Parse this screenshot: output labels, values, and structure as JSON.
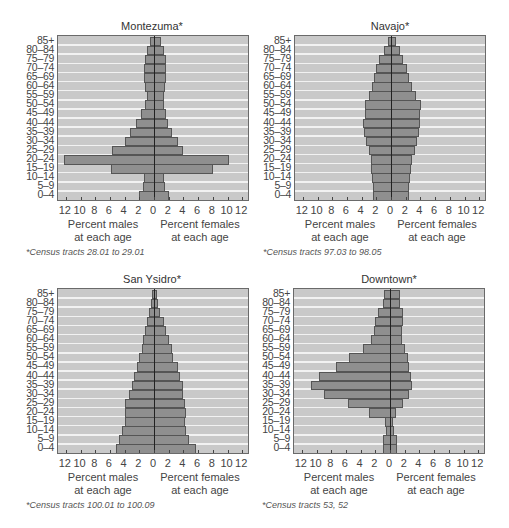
{
  "chart_data": [
    {
      "type": "bar",
      "subtype": "population-pyramid",
      "title": "Montezuma*",
      "footnote": "*Census tracts 28.01 to 29.01",
      "categories": [
        "85+",
        "80–84",
        "75–79",
        "70–74",
        "65–69",
        "60–64",
        "55–59",
        "50–54",
        "45–49",
        "40–44",
        "35–39",
        "30–34",
        "25–29",
        "20–24",
        "15–19",
        "10–14",
        "5–9",
        "0–4"
      ],
      "series": [
        {
          "name": "Percent males at each age",
          "values": [
            0.5,
            1.0,
            1.2,
            1.3,
            1.4,
            1.2,
            1.0,
            1.2,
            1.8,
            2.5,
            3.2,
            4.0,
            5.7,
            12.2,
            5.8,
            1.3,
            1.5,
            2.0
          ]
        },
        {
          "name": "Percent females at each age",
          "values": [
            1.0,
            1.4,
            1.6,
            1.6,
            1.7,
            1.5,
            1.3,
            1.4,
            1.6,
            1.9,
            2.4,
            3.2,
            3.9,
            10.2,
            8.0,
            1.4,
            1.5,
            2.0
          ]
        }
      ],
      "xlabel_left": [
        "Percent males",
        "at each age"
      ],
      "xlabel_right": [
        "Percent females",
        "at each age"
      ],
      "xticks": [
        "12",
        "10",
        "8",
        "6",
        "4",
        "2",
        "0",
        "2",
        "4",
        "6",
        "8",
        "10",
        "12"
      ],
      "xlim": [
        -12,
        12
      ],
      "grid": true
    },
    {
      "type": "bar",
      "subtype": "population-pyramid",
      "title": "Navajo*",
      "footnote": "*Census tracts 97.03 to 98.05",
      "categories": [
        "85+",
        "80–84",
        "75–79",
        "70–74",
        "65–69",
        "60–64",
        "55–59",
        "50–54",
        "45–49",
        "40–44",
        "35–39",
        "30–34",
        "25–29",
        "20–24",
        "15–19",
        "10–14",
        "5–9",
        "0–4"
      ],
      "series": [
        {
          "name": "Percent males at each age",
          "values": [
            0.4,
            0.9,
            1.6,
            2.0,
            2.3,
            2.6,
            3.0,
            3.5,
            3.5,
            3.8,
            3.7,
            3.4,
            3.0,
            2.7,
            2.7,
            2.6,
            2.5,
            2.5
          ]
        },
        {
          "name": "Percent females at each age",
          "values": [
            0.7,
            1.2,
            1.6,
            2.2,
            2.4,
            2.8,
            3.4,
            4.1,
            4.0,
            3.9,
            3.8,
            3.6,
            3.2,
            2.8,
            2.7,
            2.6,
            2.5,
            2.5
          ]
        }
      ],
      "xlabel_left": [
        "Percent males",
        "at each age"
      ],
      "xlabel_right": [
        "Percent females",
        "at each age"
      ],
      "xticks": [
        "12",
        "10",
        "8",
        "6",
        "4",
        "2",
        "0",
        "2",
        "4",
        "6",
        "8",
        "10",
        "12"
      ],
      "xlim": [
        -12,
        12
      ],
      "grid": true
    },
    {
      "type": "bar",
      "subtype": "population-pyramid",
      "title": "San Ysidro*",
      "footnote": "*Census tracts 100.01 to 100.09",
      "categories": [
        "85+",
        "80–84",
        "75–79",
        "70–74",
        "65–69",
        "60–64",
        "55–59",
        "50–54",
        "45–49",
        "40–44",
        "35–39",
        "30–34",
        "25–29",
        "20–24",
        "15–19",
        "10–14",
        "5–9",
        "0–4"
      ],
      "series": [
        {
          "name": "Percent males at each age",
          "values": [
            0.3,
            0.4,
            0.7,
            1.0,
            1.2,
            1.5,
            1.7,
            2.0,
            2.3,
            2.7,
            3.0,
            3.4,
            3.9,
            4.0,
            3.9,
            4.3,
            4.7,
            5.2
          ]
        },
        {
          "name": "Percent females at each age",
          "values": [
            0.4,
            0.6,
            0.8,
            1.3,
            1.7,
            2.0,
            2.4,
            2.6,
            3.2,
            3.6,
            3.9,
            4.0,
            4.2,
            4.4,
            4.2,
            4.3,
            4.7,
            5.7
          ]
        }
      ],
      "xlabel_left": [
        "Percent males",
        "at each age"
      ],
      "xlabel_right": [
        "Percent females",
        "at each age"
      ],
      "xticks": [
        "12",
        "10",
        "8",
        "6",
        "4",
        "2",
        "0",
        "2",
        "4",
        "6",
        "8",
        "10",
        "12"
      ],
      "xlim": [
        -12,
        12
      ],
      "grid": true
    },
    {
      "type": "bar",
      "subtype": "population-pyramid",
      "title": "Downtown*",
      "footnote": "*Census tracts 53, 52",
      "categories": [
        "85+",
        "80–84",
        "75–79",
        "70–74",
        "65–69",
        "60–64",
        "55–59",
        "50–54",
        "45–49",
        "40–44",
        "35–39",
        "30–34",
        "25–29",
        "20–24",
        "15–19",
        "10–14",
        "5–9",
        "0–4"
      ],
      "series": [
        {
          "name": "Percent males at each age",
          "values": [
            0.8,
            1.0,
            1.6,
            2.0,
            2.2,
            2.6,
            3.7,
            5.6,
            7.3,
            9.6,
            10.8,
            9.0,
            5.7,
            2.8,
            0.7,
            0.5,
            1.0,
            0.9
          ]
        },
        {
          "name": "Percent females at each age",
          "values": [
            1.4,
            1.4,
            1.8,
            1.8,
            1.6,
            1.7,
            2.0,
            2.4,
            2.6,
            2.8,
            3.0,
            2.6,
            1.8,
            0.8,
            0.4,
            0.5,
            0.9,
            1.0
          ]
        }
      ],
      "xlabel_left": [
        "Percent males",
        "at each age"
      ],
      "xlabel_right": [
        "Percent females",
        "at each age"
      ],
      "xticks": [
        "12",
        "10",
        "8",
        "6",
        "4",
        "2",
        "0",
        "2",
        "4",
        "6",
        "8",
        "10",
        "12"
      ],
      "xlim": [
        -12,
        12
      ],
      "grid": true
    }
  ],
  "colors": {
    "plot_background": "#c9c9c9",
    "stripe": "#f2f2f2",
    "bar_fill": "#8f8f8f",
    "bar_border": "#555555",
    "frame_border": "#6a6a6a"
  }
}
